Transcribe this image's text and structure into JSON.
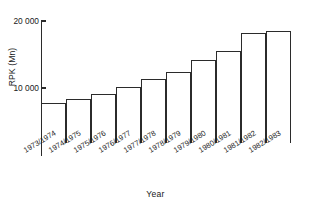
{
  "chart_data": {
    "type": "bar",
    "title": "",
    "subtitle": "",
    "xlabel": "Year",
    "ylabel": "RPK (Mn)",
    "categories": [
      "1973/1974",
      "1974/1975",
      "1975/1976",
      "1976/1977",
      "1977/1978",
      "1978/1979",
      "1979/1980",
      "1980/1981",
      "1981/1982",
      "1982/1983"
    ],
    "values": [
      5800,
      6400,
      7100,
      8100,
      9300,
      10300,
      12100,
      13500,
      16500,
      16900
    ],
    "ylim": [
      0,
      20000
    ],
    "ytick_values": [
      10000,
      20000
    ],
    "ytick_labels": [
      "10 000",
      "20 000"
    ],
    "grid": false,
    "legend": null,
    "axis_color": "#2b2b2b",
    "bar_fill": "#ffffff",
    "bar_edge": "#2b2b2b",
    "note": "bars drawn from a clipped baseline; y-axis broken below lowest bar"
  },
  "render": {
    "y_px_20000": 21,
    "y_px_10000": 88,
    "y_px_baseline": 142,
    "bar_top_px": [
      103,
      99,
      94,
      87,
      79,
      72,
      60,
      51,
      33,
      31
    ]
  }
}
